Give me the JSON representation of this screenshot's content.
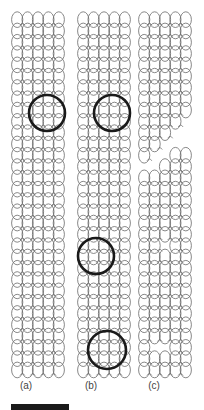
{
  "figure": {
    "panels": [
      {
        "label": "(a)",
        "x": 12,
        "label_x": 18
      },
      {
        "label": "(b)",
        "x": 78,
        "label_x": 83
      },
      {
        "label": "(c)",
        "x": 139,
        "label_x": 146
      }
    ],
    "lattice": {
      "top": 12,
      "bottom": 374,
      "columns": 5,
      "col_width": 10.4,
      "row_height": 11.3,
      "stroke": "#6a6a6a"
    },
    "defect_circles": [
      {
        "panel": "(a)",
        "cx": 47,
        "cy": 113,
        "r": 18
      },
      {
        "panel": "(b)",
        "cx": 112,
        "cy": 113,
        "r": 18
      },
      {
        "panel": "(b)",
        "cx": 96,
        "cy": 256,
        "r": 18
      },
      {
        "panel": "(b)",
        "cx": 107,
        "cy": 350,
        "r": 19
      }
    ],
    "circle_color": "#1a1a1a",
    "tear_panel": "(c)",
    "scale_bar": {
      "x": 11,
      "y": 404,
      "width": 58,
      "height": 6,
      "color": "#1a1a1a"
    }
  }
}
